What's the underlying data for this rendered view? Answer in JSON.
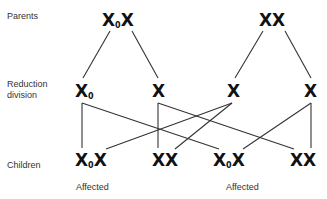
{
  "row_labels": {
    "parents": "Parents",
    "reduction": "Reduction division",
    "reduction_line1": "Reduction",
    "reduction_line2": "division",
    "children": "Children"
  },
  "parents": [
    {
      "base": "X",
      "sub": "0",
      "second": "X",
      "genotype": "X0X"
    },
    {
      "base": "X",
      "sub": "",
      "second": "X",
      "genotype": "XX"
    }
  ],
  "gametes": [
    {
      "base": "X",
      "sub": "0"
    },
    {
      "base": "X",
      "sub": ""
    },
    {
      "base": "X",
      "sub": ""
    },
    {
      "base": "X",
      "sub": ""
    }
  ],
  "children": [
    {
      "base": "X",
      "sub": "0",
      "second": "X",
      "genotype": "X0X",
      "status": "Affected"
    },
    {
      "base": "X",
      "sub": "",
      "second": "X",
      "genotype": "XX",
      "status": ""
    },
    {
      "base": "X",
      "sub": "0",
      "second": "X",
      "genotype": "X0X",
      "status": "Affected"
    },
    {
      "base": "X",
      "sub": "",
      "second": "X",
      "genotype": "XX",
      "status": ""
    }
  ],
  "colors": {
    "text": "#111111",
    "lines": "#333333",
    "labels": "#333333",
    "background": "#ffffff"
  }
}
